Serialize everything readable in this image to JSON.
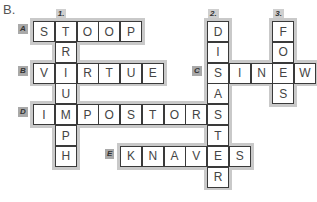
{
  "part_label": "B.",
  "grid": {
    "origin_x": 33,
    "origin_y": 21,
    "cell_w": 21.75,
    "cell_h": 20.8
  },
  "across": [
    {
      "label": "A.",
      "word": "STOOP",
      "row": 0,
      "col": 0
    },
    {
      "label": "B.",
      "word": "VIRTUE",
      "row": 2,
      "col": 0
    },
    {
      "label": "C.",
      "word": "SINEW",
      "row": 2,
      "col": 8
    },
    {
      "label": "D.",
      "word": "IMPOSTORS",
      "row": 4,
      "col": 0
    },
    {
      "label": "E.",
      "word": "KNAVES",
      "row": 6,
      "col": 4
    }
  ],
  "down": [
    {
      "label": "1.",
      "word": "TRIUMPH",
      "row": 0,
      "col": 1
    },
    {
      "label": "2.",
      "word": "DISASTER",
      "row": 0,
      "col": 8
    },
    {
      "label": "3.",
      "word": "FOES",
      "row": 0,
      "col": 11
    }
  ]
}
